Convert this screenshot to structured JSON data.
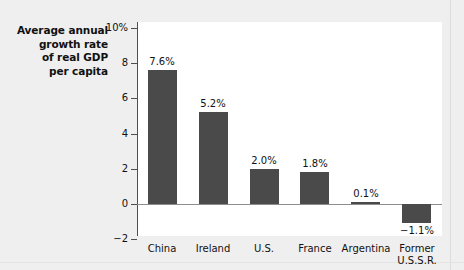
{
  "chart_data": {
    "type": "bar",
    "title": "Average annual growth rate of real GDP per capita",
    "title_lines": [
      "Average annual",
      "growth rate",
      "of real GDP",
      "per capita"
    ],
    "categories": [
      "China",
      "Ireland",
      "U.S.",
      "France",
      "Argentina",
      "Former U.S.S.R."
    ],
    "category_lines": [
      [
        "China"
      ],
      [
        "Ireland"
      ],
      [
        "U.S."
      ],
      [
        "France"
      ],
      [
        "Argentina"
      ],
      [
        "Former",
        "U.S.S.R."
      ]
    ],
    "values": [
      7.6,
      5.2,
      2.0,
      1.8,
      0.1,
      -1.1
    ],
    "value_labels": [
      "7.6%",
      "5.2%",
      "2.0%",
      "1.8%",
      "0.1%",
      "−1.1%"
    ],
    "xlabel": "",
    "ylabel": "Average annual growth rate of real GDP per capita",
    "ylim": [
      -2,
      10
    ],
    "yticks": [
      10,
      8,
      6,
      4,
      2,
      0,
      -2
    ],
    "ytick_labels": [
      "10%",
      "8",
      "6",
      "4",
      "2",
      "0",
      "−2"
    ],
    "grid": false,
    "legend": false,
    "colors": {
      "bar": "#4a4a4a",
      "background": "#efefef",
      "plot_background": "#ffffff",
      "axis": "#4f4f4f",
      "zero_line": "#8d8d8d",
      "text": "#111111"
    }
  }
}
